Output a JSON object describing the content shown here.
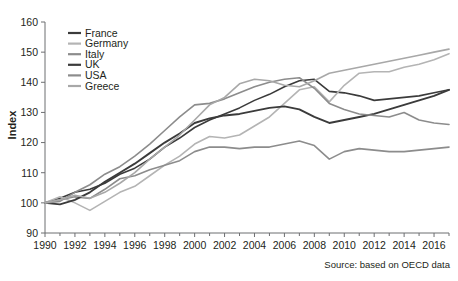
{
  "chart": {
    "type": "line",
    "title": "",
    "source_note": "Source: based on OECD data",
    "ylabel": "Index",
    "xlabel": ""
  },
  "chart_data": {
    "type": "line",
    "title": "",
    "xlabel": "",
    "ylabel": "Index",
    "xlim": [
      1990,
      2017
    ],
    "ylim": [
      90,
      160
    ],
    "yticks": [
      90,
      100,
      110,
      120,
      130,
      140,
      150,
      160
    ],
    "xticks": [
      1990,
      1992,
      1994,
      1996,
      1998,
      2000,
      2002,
      2004,
      2006,
      2008,
      2010,
      2012,
      2014,
      2016
    ],
    "xtick_labels": [
      "1990",
      "1992",
      "1994",
      "1996",
      "1998",
      "2000",
      "2002",
      "2004",
      "2006",
      "2008",
      "2010",
      "2012",
      "2014",
      "2016"
    ],
    "ytick_labels": [
      "90",
      "100",
      "110",
      "120",
      "130",
      "140",
      "150",
      "160"
    ],
    "minor_xticks": [
      1991,
      1993,
      1995,
      1997,
      1999,
      2001,
      2003,
      2005,
      2007,
      2009,
      2011,
      2013,
      2015,
      2017
    ],
    "grid": false,
    "legend_position": "upper-left",
    "x": [
      1990,
      1991,
      1992,
      1993,
      1994,
      1995,
      1996,
      1997,
      1998,
      1999,
      2000,
      2001,
      2002,
      2003,
      2004,
      2005,
      2006,
      2007,
      2008,
      2009,
      2010,
      2011,
      2012,
      2013,
      2014,
      2015,
      2016,
      2017
    ],
    "series": [
      {
        "name": "France",
        "color": "#3b3b3b",
        "width": 1.6,
        "values": [
          100,
          101.5,
          103.5,
          104.5,
          106.5,
          109.5,
          111.5,
          114.5,
          118.5,
          121.5,
          125.0,
          127.5,
          129.5,
          131.5,
          134.0,
          136.0,
          138.5,
          140.5,
          141.0,
          137.0,
          136.5,
          135.5,
          134.0,
          134.5,
          135.0,
          135.5,
          136.5,
          137.5
        ]
      },
      {
        "name": "Germany",
        "color": "#b4b4b4",
        "width": 1.6,
        "values": [
          100,
          102.0,
          100.0,
          97.5,
          100.5,
          103.5,
          105.5,
          109.0,
          112.5,
          115.5,
          119.5,
          122.0,
          121.5,
          122.5,
          125.5,
          128.5,
          133.0,
          137.5,
          138.5,
          133.5,
          139.0,
          143.0,
          143.5,
          143.5,
          145.0,
          146.0,
          147.5,
          149.5
        ]
      },
      {
        "name": "Italy",
        "color": "#8c8c8c",
        "width": 1.6,
        "values": [
          100,
          101.0,
          102.0,
          101.5,
          104.5,
          108.0,
          109.0,
          111.0,
          112.5,
          114.0,
          117.0,
          118.5,
          118.5,
          118.0,
          118.5,
          118.5,
          119.5,
          120.5,
          119.0,
          114.5,
          117.0,
          118.0,
          117.5,
          117.0,
          117.0,
          117.5,
          118.0,
          118.5
        ]
      },
      {
        "name": "UK",
        "color": "#3b3b3b",
        "width": 1.9,
        "values": [
          100,
          99.5,
          101.0,
          103.5,
          107.0,
          110.0,
          113.0,
          116.5,
          120.0,
          123.0,
          126.5,
          128.0,
          129.0,
          129.5,
          130.5,
          131.5,
          132.0,
          131.0,
          128.5,
          126.5,
          127.5,
          128.5,
          129.5,
          131.0,
          132.5,
          134.0,
          135.5,
          137.5
        ]
      },
      {
        "name": "USA",
        "color": "#8c8c8c",
        "width": 1.6,
        "values": [
          100,
          100.5,
          103.5,
          106.0,
          109.5,
          112.0,
          115.5,
          119.5,
          124.0,
          128.5,
          132.5,
          133.0,
          134.5,
          136.5,
          138.5,
          140.0,
          141.0,
          141.5,
          138.0,
          133.0,
          131.0,
          129.5,
          129.0,
          128.5,
          130.0,
          127.5,
          126.5,
          126.0
        ]
      },
      {
        "name": "Greece",
        "color": "#a8a8a8",
        "width": 1.6,
        "values": [
          100,
          101.0,
          102.5,
          101.5,
          103.5,
          106.5,
          110.0,
          114.5,
          118.5,
          122.5,
          127.5,
          132.5,
          135.0,
          139.5,
          141.0,
          140.5,
          139.0,
          138.5,
          140.5,
          143.0,
          144.0,
          145.0,
          146.0,
          147.0,
          148.0,
          149.0,
          150.0,
          151.0
        ]
      }
    ],
    "legend": [
      "France",
      "Germany",
      "Italy",
      "UK",
      "USA",
      "Greece"
    ]
  },
  "legend": {
    "items": [
      {
        "label": "France"
      },
      {
        "label": "Germany"
      },
      {
        "label": "Italy"
      },
      {
        "label": "UK"
      },
      {
        "label": "USA"
      },
      {
        "label": "Greece"
      }
    ]
  }
}
